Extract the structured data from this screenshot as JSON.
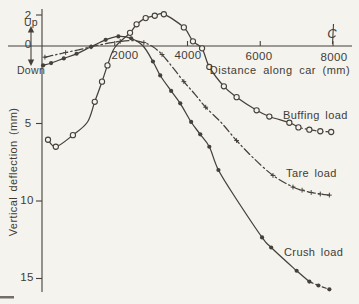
{
  "chart_data": {
    "type": "line",
    "title": "",
    "xlabel": "Distance along car (mm)",
    "ylabel": "Vertical deflection (mm)",
    "x_ticks": [
      "2000",
      "4000",
      "6000",
      "8000"
    ],
    "x_tick_values": [
      2000,
      4000,
      6000,
      8000
    ],
    "y_ticks": [
      "2",
      "0",
      "5",
      "10",
      "15"
    ],
    "y_tick_values": [
      -2,
      0,
      5,
      10,
      15
    ],
    "xlim": [
      0,
      8500
    ],
    "ylim_deflection": [
      -2.5,
      16
    ],
    "y_axis_direction_labels": {
      "up": "Up",
      "down": "Down"
    },
    "centerline_symbol": "C",
    "centerline_at_mm": 8000,
    "note": "point format [distance_mm, deflection_mm (positive = down, negative = up), marker_flag]",
    "series": [
      {
        "name": "Buffing load",
        "marker": "open-circle",
        "line_dash": "",
        "dash_tail_from": 6900,
        "tail_dash": "4 3",
        "points": [
          [
            165,
            6.05,
            1
          ],
          [
            380,
            6.5,
            1
          ],
          [
            850,
            5.75,
            1
          ],
          [
            1250,
            4.9,
            0
          ],
          [
            1450,
            3.6,
            1
          ],
          [
            1650,
            2.3,
            1
          ],
          [
            1800,
            1.25,
            1
          ],
          [
            2000,
            0.1,
            0
          ],
          [
            2420,
            -0.85,
            1
          ],
          [
            2600,
            -1.4,
            1
          ],
          [
            2850,
            -1.8,
            1
          ],
          [
            3100,
            -1.95,
            1
          ],
          [
            3350,
            -2.05,
            1
          ],
          [
            3900,
            -1.2,
            1
          ],
          [
            4150,
            -0.3,
            1
          ],
          [
            4400,
            0.15,
            1
          ],
          [
            4600,
            1.35,
            1
          ],
          [
            5000,
            2.6,
            1
          ],
          [
            5350,
            3.3,
            1
          ],
          [
            5900,
            4.15,
            1
          ],
          [
            6250,
            4.55,
            1
          ],
          [
            6800,
            4.95,
            1
          ],
          [
            7050,
            5.25,
            1
          ],
          [
            7350,
            5.4,
            1
          ],
          [
            7650,
            5.5,
            1
          ],
          [
            7950,
            5.55,
            1
          ]
        ]
      },
      {
        "name": "Tare load",
        "marker": "plus",
        "line_dash": "8 3 1.5 3",
        "dash_tail_from": null,
        "tail_dash": "",
        "points": [
          [
            80,
            0.72,
            1
          ],
          [
            350,
            0.58,
            0
          ],
          [
            650,
            0.42,
            1
          ],
          [
            1000,
            0.25,
            0
          ],
          [
            1350,
            0.05,
            1
          ],
          [
            1750,
            -0.15,
            0
          ],
          [
            2150,
            -0.3,
            1
          ],
          [
            2500,
            -0.35,
            0
          ],
          [
            2800,
            -0.22,
            1
          ],
          [
            3050,
            0.05,
            0
          ],
          [
            3300,
            0.55,
            1
          ],
          [
            3600,
            1.4,
            0
          ],
          [
            3900,
            2.3,
            1
          ],
          [
            4200,
            3.1,
            0
          ],
          [
            4500,
            3.95,
            1
          ],
          [
            4950,
            5.0,
            0
          ],
          [
            5350,
            6.1,
            1
          ],
          [
            5800,
            7.2,
            0
          ],
          [
            6350,
            8.35,
            1
          ],
          [
            6900,
            9.1,
            1
          ],
          [
            7150,
            9.3,
            1
          ],
          [
            7400,
            9.45,
            1
          ],
          [
            7650,
            9.55,
            1
          ],
          [
            7900,
            9.62,
            1
          ]
        ]
      },
      {
        "name": "Crush load",
        "marker": "filled-circle",
        "line_dash": "",
        "dash_tail_from": 7350,
        "tail_dash": "4 3",
        "points": [
          [
            30,
            1.25,
            1
          ],
          [
            250,
            1.1,
            1
          ],
          [
            600,
            0.8,
            1
          ],
          [
            950,
            0.5,
            1
          ],
          [
            1350,
            0.05,
            1
          ],
          [
            1750,
            -0.4,
            1
          ],
          [
            2100,
            -0.62,
            1
          ],
          [
            2450,
            -0.5,
            1
          ],
          [
            2780,
            0.0,
            0
          ],
          [
            3050,
            1.0,
            1
          ],
          [
            3250,
            1.9,
            1
          ],
          [
            3550,
            2.9,
            1
          ],
          [
            3800,
            3.7,
            1
          ],
          [
            4100,
            4.9,
            1
          ],
          [
            4350,
            5.7,
            1
          ],
          [
            4600,
            6.5,
            1
          ],
          [
            4850,
            8.0,
            1
          ],
          [
            5350,
            9.9,
            0
          ],
          [
            6050,
            12.35,
            1
          ],
          [
            6300,
            13.0,
            1
          ],
          [
            7000,
            14.5,
            1
          ],
          [
            7350,
            15.2,
            1
          ],
          [
            7600,
            15.45,
            1
          ],
          [
            7900,
            15.7,
            1
          ]
        ]
      }
    ]
  }
}
